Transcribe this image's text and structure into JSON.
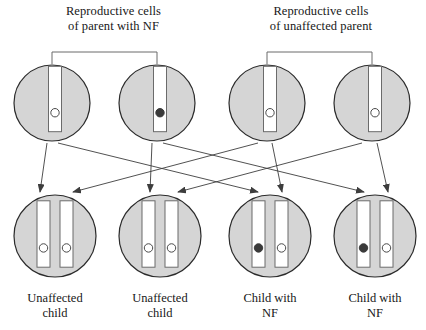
{
  "figure": {
    "type": "genetics-inheritance-diagram",
    "background_color": "#ffffff",
    "cell_fill_color": "#d5d5d5",
    "cell_stroke_color": "#2b2b2b",
    "chromosome_fill_color": "#ffffff",
    "chromosome_stroke_color": "#6b6b6b",
    "allele_normal_color": "#ffffff",
    "allele_nf_color": "#3a3a3a",
    "arrow_color": "#3d3d3d",
    "bracket_color": "#6b6b6b"
  },
  "headings": {
    "left": "Reproductive cells\nof parent with NF",
    "right": "Reproductive cells\nof unaffected parent"
  },
  "parents": [
    {
      "id": "parent-with-nf",
      "label": "Reproductive cells of parent with NF",
      "bracket": {
        "x1": 52,
        "x2": 157,
        "y": 52,
        "drop": 12
      },
      "gametes": [
        {
          "id": "gamete-1",
          "cx": 52,
          "cy": 103,
          "r": 38,
          "alleles": [
            "normal"
          ]
        },
        {
          "id": "gamete-2",
          "cx": 157,
          "cy": 103,
          "r": 38,
          "alleles": [
            "nf"
          ]
        }
      ]
    },
    {
      "id": "unaffected-parent",
      "label": "Reproductive cells of unaffected parent",
      "bracket": {
        "x1": 267,
        "x2": 372,
        "y": 52,
        "drop": 12
      },
      "gametes": [
        {
          "id": "gamete-3",
          "cx": 267,
          "cy": 103,
          "r": 38,
          "alleles": [
            "normal"
          ]
        },
        {
          "id": "gamete-4",
          "cx": 372,
          "cy": 103,
          "r": 38,
          "alleles": [
            "normal"
          ]
        }
      ]
    }
  ],
  "children": [
    {
      "id": "child-1",
      "cx": 55,
      "cy": 236,
      "r": 41,
      "alleles": [
        "normal",
        "normal"
      ],
      "label": "Unaffected\nchild",
      "affected": false
    },
    {
      "id": "child-2",
      "cx": 160,
      "cy": 236,
      "r": 41,
      "alleles": [
        "normal",
        "normal"
      ],
      "label": "Unaffected\nchild",
      "affected": false
    },
    {
      "id": "child-3",
      "cx": 270,
      "cy": 236,
      "r": 41,
      "alleles": [
        "nf",
        "normal"
      ],
      "label": "Child with\nNF",
      "affected": true
    },
    {
      "id": "child-4",
      "cx": 375,
      "cy": 236,
      "r": 41,
      "alleles": [
        "nf",
        "normal"
      ],
      "label": "Child with\nNF",
      "affected": true
    }
  ],
  "arrows": [
    {
      "id": "arrow-g1-c1",
      "from": "gamete-1",
      "to": "child-1",
      "x1": 47,
      "y1": 143,
      "x2": 40,
      "y2": 192
    },
    {
      "id": "arrow-g1-c3",
      "from": "gamete-1",
      "to": "child-3",
      "x1": 58,
      "y1": 143,
      "x2": 258,
      "y2": 192
    },
    {
      "id": "arrow-g2-c2",
      "from": "gamete-2",
      "to": "child-2",
      "x1": 152,
      "y1": 143,
      "x2": 150,
      "y2": 192
    },
    {
      "id": "arrow-g2-c4",
      "from": "gamete-2",
      "to": "child-4",
      "x1": 163,
      "y1": 143,
      "x2": 364,
      "y2": 192
    },
    {
      "id": "arrow-g3-c1",
      "from": "gamete-3",
      "to": "child-1",
      "x1": 258,
      "y1": 143,
      "x2": 73,
      "y2": 192
    },
    {
      "id": "arrow-g3-c3",
      "from": "gamete-3",
      "to": "child-3",
      "x1": 272,
      "y1": 143,
      "x2": 282,
      "y2": 192
    },
    {
      "id": "arrow-g4-c2",
      "from": "gamete-4",
      "to": "child-2",
      "x1": 362,
      "y1": 143,
      "x2": 178,
      "y2": 192
    },
    {
      "id": "arrow-g4-c4",
      "from": "gamete-4",
      "to": "child-4",
      "x1": 377,
      "y1": 143,
      "x2": 388,
      "y2": 192
    }
  ],
  "legend": {
    "normal_allele": "Open circle = normal allele",
    "nf_allele": "Filled circle = NF allele"
  }
}
